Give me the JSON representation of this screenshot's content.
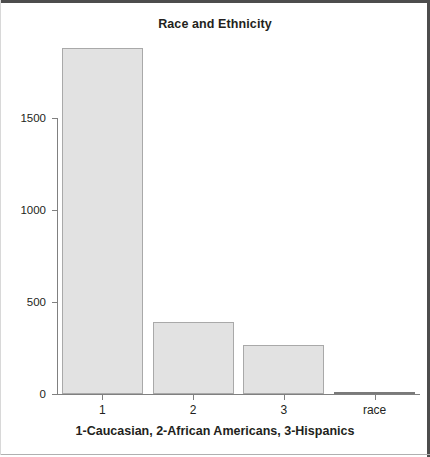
{
  "chart_data": {
    "type": "bar",
    "title": "Race and Ethnicity",
    "xlabel": "1-Caucasian, 2-African Americans, 3-Hispanics",
    "ylabel": "",
    "categories": [
      "1",
      "2",
      "3",
      "race"
    ],
    "values": [
      1880,
      390,
      265,
      8
    ],
    "ylim": [
      0,
      1900
    ],
    "yticks": [
      0,
      500,
      1000,
      1500
    ],
    "ytick_labels": [
      "0",
      "500",
      "1000",
      "1500"
    ],
    "xtick_labels": [
      "1",
      "2",
      "3",
      "race"
    ],
    "grid": false,
    "legend": false,
    "bar_color": "#e2e2e2",
    "bar_border_color": "#a9a9a9",
    "axis_color": "#808080",
    "text_color": "#231f20"
  },
  "frame": {
    "top_color": "#4d4d4d",
    "right_color": "#4d4d4d",
    "bottom_color": "#b0b0b0"
  }
}
